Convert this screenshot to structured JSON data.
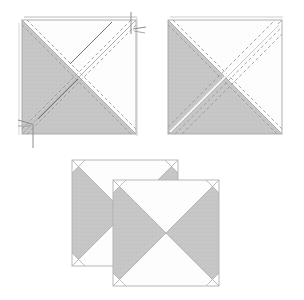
{
  "figure": {
    "title": "Half-square and quarter-square triangle piecing diagram",
    "canvas": {
      "width": 304,
      "height": 300,
      "background": "#ffffff"
    },
    "colors": {
      "fabric_gray": "#c6c6c6",
      "fabric_gray_dark": "#b9b9b9",
      "fabric_white": "#fdfdfd",
      "outline": "#9a9a9a",
      "outline_light": "#c4c4c4",
      "stitch_dash": "#9b9b9b",
      "stitch_dark": "#6f6f6f",
      "pin": "#8d8d8d",
      "shadow": "#d9d9d9"
    },
    "stroke_widths": {
      "outline": 0.9,
      "diagonal": 0.9,
      "dash": 0.9,
      "pin": 0.9
    },
    "dash_patterns": {
      "stitch_line": "3.2 2.6",
      "fine_stitch": "2.2 2.0"
    }
  },
  "panels": [
    {
      "id": "panel-1",
      "label": "Step 1 square with marked sewing lines and pins",
      "square": {
        "x": 22,
        "y": 20,
        "size": 114
      },
      "shaded_regions": [
        {
          "name": "left-triangle",
          "points": "22,20 22,134 79,77"
        },
        {
          "name": "bottom-triangle",
          "points": "22,134 136,134 79,77"
        }
      ],
      "white_regions": [
        {
          "name": "top-triangle",
          "points": "22,20 136,20 79,77"
        },
        {
          "name": "right-triangle",
          "points": "136,20 136,134 79,77"
        }
      ],
      "diagonals": [
        {
          "name": "diagonal-tl-br",
          "x1": 22,
          "y1": 20,
          "x2": 136,
          "y2": 134
        },
        {
          "name": "diagonal-bl-tr",
          "x1": 22,
          "y1": 134,
          "x2": 136,
          "y2": 20
        }
      ],
      "stitch_lines": [
        {
          "name": "stitch-above-tlbr",
          "x1": 27,
          "y1": 20,
          "x2": 136,
          "y2": 129,
          "style": "dash"
        },
        {
          "name": "stitch-below-tlbr",
          "x1": 22,
          "y1": 25,
          "x2": 131,
          "y2": 134,
          "style": "dash"
        },
        {
          "name": "stitch-above-bltr",
          "x1": 27,
          "y1": 134,
          "x2": 136,
          "y2": 25,
          "style": "dash"
        },
        {
          "name": "stitch-below-bltr",
          "x1": 22,
          "y1": 129,
          "x2": 131,
          "y2": 20,
          "style": "dash"
        },
        {
          "name": "stitch-center-solid-upper",
          "x1": 68,
          "y1": 66,
          "x2": 110,
          "y2": 24,
          "style": "solid-dark"
        },
        {
          "name": "stitch-center-solid-lower",
          "x1": 38,
          "y1": 119,
          "x2": 76,
          "y2": 81,
          "style": "solid-dark"
        }
      ],
      "pins": [
        {
          "name": "pin-top-right",
          "shaft": "130,14 140,32",
          "head": "136,32 146,30"
        },
        {
          "name": "pin-bottom-left",
          "shaft": "36,122 30,144",
          "head": "22,120 34,125"
        }
      ],
      "offset_edges": [
        {
          "name": "top-edge-offset",
          "x1": 24,
          "y1": 17,
          "x2": 137,
          "y2": 17
        },
        {
          "name": "left-edge-offset",
          "x1": 19,
          "y1": 23,
          "x2": 19,
          "y2": 135
        }
      ]
    },
    {
      "id": "panel-2",
      "label": "Step 2 square showing trimmed seam allowances",
      "square": {
        "x": 168,
        "y": 20,
        "size": 114
      },
      "shaded_regions": [
        {
          "name": "left-triangle",
          "points": "168,20 168,134 225,77"
        },
        {
          "name": "bottom-triangle",
          "points": "168,134 282,134 225,77"
        }
      ],
      "white_regions": [
        {
          "name": "top-triangle",
          "points": "168,20 282,20 225,77"
        },
        {
          "name": "right-triangle",
          "points": "282,20 282,134 225,77"
        }
      ],
      "diagonals": [
        {
          "name": "diagonal-tl-br",
          "x1": 168,
          "y1": 20,
          "x2": 282,
          "y2": 134
        },
        {
          "name": "diagonal-bl-tr",
          "x1": 168,
          "y1": 134,
          "x2": 282,
          "y2": 20
        }
      ],
      "stitch_lines": [
        {
          "name": "stitch-upper-left-dash",
          "x1": 172,
          "y1": 20,
          "x2": 282,
          "y2": 130,
          "style": "dash"
        },
        {
          "name": "stitch-lower-right-dash",
          "x1": 168,
          "y1": 25,
          "x2": 277,
          "y2": 134,
          "style": "dash"
        },
        {
          "name": "stitch-bltr-upper",
          "x1": 174,
          "y1": 134,
          "x2": 282,
          "y2": 26,
          "style": "dash"
        },
        {
          "name": "stitch-bltr-lower",
          "x1": 168,
          "y1": 128,
          "x2": 276,
          "y2": 20,
          "style": "dash"
        },
        {
          "name": "stitch-bltr-extra",
          "x1": 180,
          "y1": 134,
          "x2": 282,
          "y2": 32,
          "style": "dash"
        }
      ],
      "pins": [],
      "offset_edges": [
        {
          "name": "top-edge-offset",
          "x1": 170,
          "y1": 17,
          "x2": 283,
          "y2": 17
        }
      ]
    },
    {
      "id": "panel-3",
      "label": "Two finished hourglass blocks stacked and offset",
      "blocks": [
        {
          "name": "back-block",
          "square": {
            "x": 72,
            "y": 160,
            "size": 106
          },
          "shaded_regions": [
            {
              "name": "left-triangle",
              "points": "72,160 72,266 125,213"
            },
            {
              "name": "right-triangle",
              "points": "178,160 178,266 125,213"
            }
          ],
          "white_regions": [
            {
              "name": "top-triangle",
              "points": "72,160 178,160 125,213"
            },
            {
              "name": "bottom-triangle",
              "points": "72,266 178,266 125,213"
            }
          ],
          "corner_notches": [
            {
              "name": "notch-top-left",
              "points": "72,160 84,160 72,172"
            },
            {
              "name": "notch-top-right",
              "points": "178,160 166,160 178,172"
            },
            {
              "name": "notch-bottom-left",
              "points": "72,266 84,266 72,254"
            },
            {
              "name": "notch-bottom-right",
              "points": "178,266 166,266 178,254"
            }
          ]
        },
        {
          "name": "front-block",
          "square": {
            "x": 113,
            "y": 180,
            "size": 106
          },
          "shaded_regions": [
            {
              "name": "left-triangle",
              "points": "113,180 113,286 166,233"
            },
            {
              "name": "right-triangle",
              "points": "219,180 219,286 166,233"
            }
          ],
          "white_regions": [
            {
              "name": "top-triangle",
              "points": "113,180 219,180 166,233"
            },
            {
              "name": "bottom-triangle",
              "points": "113,286 219,286 166,233"
            }
          ],
          "corner_notches": [
            {
              "name": "notch-top-left",
              "points": "113,180 125,180 113,192"
            },
            {
              "name": "notch-top-right",
              "points": "219,180 207,180 219,192"
            },
            {
              "name": "notch-bottom-left",
              "points": "113,286 125,286 113,274"
            },
            {
              "name": "notch-bottom-right",
              "points": "219,286 207,286 219,274"
            }
          ]
        }
      ]
    }
  ]
}
